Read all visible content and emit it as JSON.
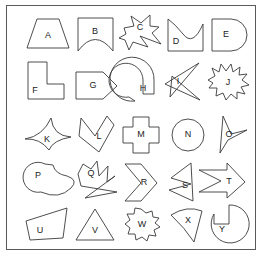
{
  "figure": {
    "title": "",
    "border_color": "#5a5a5a",
    "background_color": "#ffffff",
    "stroke_color": "#3a3a3a",
    "label_color": "#222222",
    "rows": 5,
    "columns": 5,
    "shape_count": 25
  },
  "shapes": [
    {
      "label": "A",
      "name": "trapezoid",
      "row": 1,
      "col": 1
    },
    {
      "label": "B",
      "name": "banner-concave-bottom",
      "row": 1,
      "col": 2
    },
    {
      "label": "C",
      "name": "jagged-star-with-arrow-notch",
      "row": 1,
      "col": 3
    },
    {
      "label": "D",
      "name": "wave-flag",
      "row": 1,
      "col": 4
    },
    {
      "label": "E",
      "name": "rounded-end-rectangle",
      "row": 1,
      "col": 5
    },
    {
      "label": "F",
      "name": "l-shape",
      "row": 2,
      "col": 1
    },
    {
      "label": "G",
      "name": "pentagon-arrow-right",
      "row": 2,
      "col": 2
    },
    {
      "label": "H",
      "name": "spiral-swirl",
      "row": 2,
      "col": 3
    },
    {
      "label": "I",
      "name": "self-intersecting-bowtie",
      "row": 2,
      "col": 4
    },
    {
      "label": "J",
      "name": "spiky-starburst",
      "row": 2,
      "col": 5
    },
    {
      "label": "K",
      "name": "concave-four-point-star",
      "row": 3,
      "col": 1
    },
    {
      "label": "L",
      "name": "heart-chevron-polygon",
      "row": 3,
      "col": 2
    },
    {
      "label": "M",
      "name": "cross-plus",
      "row": 3,
      "col": 3
    },
    {
      "label": "N",
      "name": "circle",
      "row": 3,
      "col": 4
    },
    {
      "label": "O",
      "name": "concave-dart-triangle",
      "row": 3,
      "col": 5
    },
    {
      "label": "P",
      "name": "crescent-blob",
      "row": 4,
      "col": 1
    },
    {
      "label": "Q",
      "name": "jagged-self-intersecting-polygon",
      "row": 4,
      "col": 2
    },
    {
      "label": "R",
      "name": "chevron-arrow-right",
      "row": 4,
      "col": 3
    },
    {
      "label": "S",
      "name": "concave-arrow-pentagon",
      "row": 4,
      "col": 4
    },
    {
      "label": "T",
      "name": "block-arrow-right",
      "row": 4,
      "col": 5
    },
    {
      "label": "U",
      "name": "irregular-quadrilateral",
      "row": 5,
      "col": 1
    },
    {
      "label": "V",
      "name": "triangle",
      "row": 5,
      "col": 2
    },
    {
      "label": "W",
      "name": "scalloped-cloud",
      "row": 5,
      "col": 3
    },
    {
      "label": "X",
      "name": "curved-concave-triangle",
      "row": 5,
      "col": 4
    },
    {
      "label": "Y",
      "name": "pac-man-notched-circle",
      "row": 5,
      "col": 5
    }
  ]
}
